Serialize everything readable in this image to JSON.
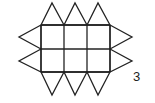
{
  "figure": {
    "label": "3",
    "grid": {
      "rows": 2,
      "cols": 3,
      "x": [
        41,
        64,
        87,
        110
      ],
      "y": [
        25,
        49,
        72
      ]
    },
    "triangles": {
      "top": [
        [
          41,
          25,
          64,
          25,
          52,
          3
        ],
        [
          64,
          25,
          87,
          25,
          75,
          3
        ],
        [
          87,
          25,
          110,
          25,
          98,
          3
        ]
      ],
      "bottom": [
        [
          41,
          72,
          64,
          72,
          52,
          95
        ],
        [
          64,
          72,
          87,
          72,
          75,
          95
        ],
        [
          87,
          72,
          110,
          72,
          98,
          95
        ]
      ],
      "left": [
        [
          41,
          25,
          41,
          49,
          19,
          37
        ],
        [
          41,
          49,
          41,
          72,
          19,
          61
        ]
      ],
      "right": [
        [
          110,
          25,
          110,
          49,
          132,
          37
        ],
        [
          110,
          49,
          110,
          72,
          132,
          61
        ]
      ]
    },
    "stroke_color": "#222222"
  }
}
